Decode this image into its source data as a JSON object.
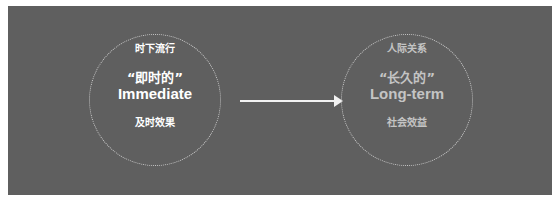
{
  "diagram": {
    "left": {
      "top_label": "时下流行",
      "quote": "“即时的”",
      "english": "Immediate",
      "bottom_label": "及时效果"
    },
    "right": {
      "top_label": "人际关系",
      "quote": "“长久的”",
      "english": "Long-term",
      "bottom_label": "社会效益"
    },
    "arrow": "right-arrow",
    "colors": {
      "background": "#5f5f5f",
      "left_text": "#ffffff",
      "right_text": "#c4c4c4",
      "circle_border": "#c8c8c8"
    }
  }
}
